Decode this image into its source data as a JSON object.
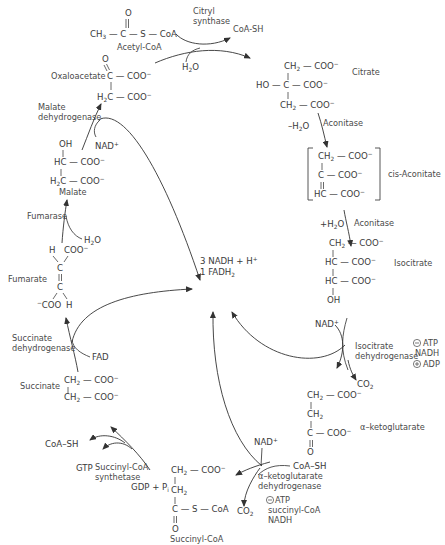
{
  "diagram": {
    "center": {
      "line1": "3 NADH + H",
      "line1_sup": "+",
      "line2": "1 FADH",
      "line2_sub": "2"
    },
    "metabolites": {
      "acetyl_coa": {
        "name": "Acetyl-CoA",
        "formula": "CH3—C(=O)—S—CoA"
      },
      "oxaloacetate": {
        "name": "Oxaloacetate",
        "formula": "O=C(COO−)—H2C—COO−"
      },
      "citrate": {
        "name": "Citrate",
        "formula": "CH2—COO− / HO—C—COO− / CH2—COO−"
      },
      "cis_aconitate": {
        "name": "cis-Aconitate",
        "formula": "[CH2—COO− / C—COO− / HC—COO−]"
      },
      "isocitrate": {
        "name": "Isocitrate",
        "formula": "CH2—COO− / HC—COO− / HC—COO− / OH"
      },
      "alpha_ketoglutarate": {
        "name": "α–ketoglutarate",
        "formula": "CH2—COO− / CH2 / C(=O)—COO−"
      },
      "succinyl_coa": {
        "name": "Succinyl-CoA",
        "formula": "CH2—COO− / CH2 / C(=O)—S—CoA"
      },
      "succinate": {
        "name": "Succinate",
        "formula": "CH2—COO− / CH2—COO−"
      },
      "fumarate": {
        "name": "Fumarate",
        "formula": "H, COO− / C=C / −COO, H"
      },
      "malate": {
        "name": "Malate",
        "formula": "OH / HC—COO− / H2C—COO−"
      }
    },
    "enzymes": {
      "citryl_synthase": {
        "line1": "Citryl",
        "line2": "synthase"
      },
      "aconitase_1": "Aconitase",
      "aconitase_2": "Aconitase",
      "isocitrate_dh": {
        "line1": "Isocitrate",
        "line2": "dehydrogenase",
        "regulators": [
          "ATP",
          "NADH",
          "ADP"
        ],
        "regulator_signs": [
          "⊖",
          "",
          "⊕"
        ]
      },
      "akg_dh": {
        "line1": "α–ketoglutarate",
        "line2": "dehydrogenase",
        "regulators": [
          "ATP",
          "succinyl-CoA",
          "NADH"
        ],
        "regulator_signs": [
          "⊖",
          "",
          ""
        ]
      },
      "succinyl_coa_synthetase": {
        "line1": "Succinyl-CoA",
        "line2": "synthetase"
      },
      "succinate_dh": {
        "line1": "Succinate",
        "line2": "dehydrogenase"
      },
      "fumarase": "Fumarase",
      "malate_dh": {
        "line1": "Malate",
        "line2": "dehydrogenase"
      }
    },
    "cofactors": {
      "coa_sh_top": "CoA-SH",
      "h2o_citrate": "H2O",
      "minus_h2o": "–H2O",
      "plus_h2o": "+H2O",
      "nad_isocitrate": "NAD+",
      "co2_isocitrate": "CO2",
      "nad_akg": "NAD+",
      "coa_sh_akg": "CoA–SH",
      "co2_akg": "CO2",
      "coa_sh_succ": "CoA–SH",
      "gtp": "GTP",
      "gdp_pi": "GDP + Pi",
      "fad": "FAD",
      "h2o_fumarase": "H2O",
      "nad_malate": "NAD+"
    }
  }
}
